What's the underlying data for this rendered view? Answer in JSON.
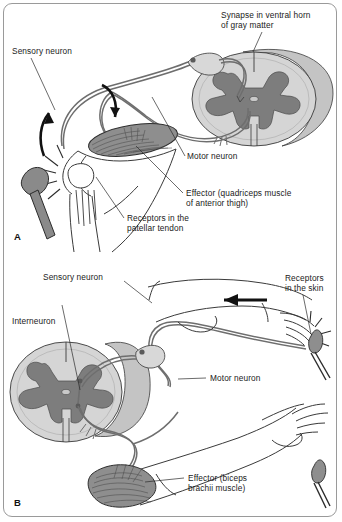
{
  "figure": {
    "panels": [
      {
        "id": "A",
        "name": "patellar-stretch-reflex",
        "marker": "A",
        "labels": [
          {
            "name": "synapse-ventral-horn",
            "line1": "Synapse in ventral horn",
            "line2": "of gray matter"
          },
          {
            "name": "sensory-neuron",
            "line1": "Sensory neuron",
            "line2": ""
          },
          {
            "name": "motor-neuron",
            "line1": "Motor neuron",
            "line2": ""
          },
          {
            "name": "effector-quadriceps",
            "line1": "Effector (quadriceps muscle",
            "line2": "of anterior thigh)"
          },
          {
            "name": "receptors-patellar-tendon",
            "line1": "Receptors in the",
            "line2": "patellar tendon"
          }
        ]
      },
      {
        "id": "B",
        "name": "withdrawal-flexor-reflex",
        "marker": "B",
        "labels": [
          {
            "name": "sensory-neuron",
            "line1": "Sensory neuron",
            "line2": ""
          },
          {
            "name": "interneuron",
            "line1": "Interneuron",
            "line2": ""
          },
          {
            "name": "receptors-skin",
            "line1": "Receptors",
            "line2": "in the skin"
          },
          {
            "name": "motor-neuron",
            "line1": "Motor neuron",
            "line2": ""
          },
          {
            "name": "effector-biceps",
            "line1": "Effector (biceps",
            "line2": "brachii muscle)"
          }
        ]
      }
    ],
    "colors": {
      "gray_matter": "#7d7d7d",
      "white_matter": "#cfcfcf",
      "cord_shade": "#bdbdbd",
      "muscle": "#8e8e8e",
      "hammer": "#8a8a8a",
      "nerve": "#6e6e6e",
      "outline": "#2b2b2b",
      "frame": "#9a9a9a",
      "background": "#ffffff"
    }
  }
}
